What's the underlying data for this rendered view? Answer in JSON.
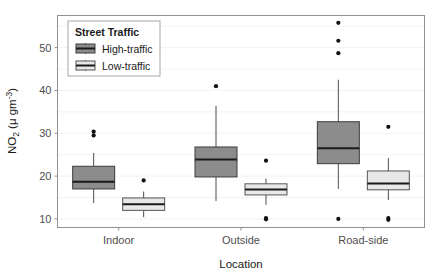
{
  "chart_data": {
    "type": "box",
    "title": "",
    "xlabel": "Location",
    "ylabel": "NO2 (μ gm⁻³)",
    "ylabel_main": "NO",
    "ylabel_sub": "2",
    "ylabel_rest": " (μ gm",
    "ylabel_sup": "-3",
    "ylabel_close": ")",
    "categories": [
      "Indoor",
      "Outside",
      "Road-side"
    ],
    "ylim": [
      8.0,
      57.5
    ],
    "yticks": [
      10,
      20,
      30,
      40,
      50
    ],
    "ytick_labels": [
      "10",
      "20",
      "30",
      "40",
      "50"
    ],
    "grid": "horizontal-major-only",
    "legend": {
      "title": "Street Traffic",
      "position": "top-left-inside",
      "entries": [
        {
          "label": "High-traffic",
          "color": "#8c8c8c"
        },
        {
          "label": "Low-traffic",
          "color": "#e8e8e8"
        }
      ]
    },
    "series": [
      {
        "name": "High-traffic",
        "color": "#8c8c8c",
        "boxes": [
          {
            "category": "Indoor",
            "lower_whisker": 13.7,
            "q1": 17.0,
            "median": 18.7,
            "q3": 22.3,
            "upper_whisker": 25.4,
            "outliers": [
              29.5,
              30.4
            ]
          },
          {
            "category": "Outside",
            "lower_whisker": 14.2,
            "q1": 19.8,
            "median": 23.9,
            "q3": 26.8,
            "upper_whisker": 36.4,
            "outliers": [
              41.0
            ]
          },
          {
            "category": "Road-side",
            "lower_whisker": 17.0,
            "q1": 22.9,
            "median": 26.5,
            "q3": 32.7,
            "upper_whisker": 42.5,
            "outliers": [
              55.8,
              51.6,
              48.7,
              10.0
            ]
          }
        ]
      },
      {
        "name": "Low-traffic",
        "color": "#e8e8e8",
        "boxes": [
          {
            "category": "Indoor",
            "lower_whisker": 10.4,
            "q1": 12.0,
            "median": 13.4,
            "q3": 14.9,
            "upper_whisker": 16.4,
            "outliers": [
              19.0
            ]
          },
          {
            "category": "Outside",
            "lower_whisker": 13.3,
            "q1": 15.6,
            "median": 16.9,
            "q3": 18.2,
            "upper_whisker": 19.4,
            "outliers": [
              23.6,
              10.2,
              9.9
            ]
          },
          {
            "category": "Road-side",
            "lower_whisker": 14.4,
            "q1": 16.8,
            "median": 18.3,
            "q3": 21.2,
            "upper_whisker": 24.2,
            "outliers": [
              31.5,
              10.2,
              9.8
            ]
          }
        ]
      }
    ]
  }
}
